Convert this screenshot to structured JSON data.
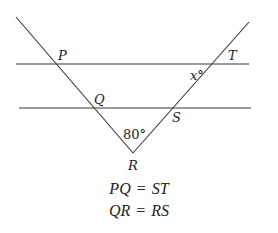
{
  "diagram": {
    "type": "geometry",
    "parallel_lines": [
      {
        "name": "upper-line",
        "x1": 16,
        "y1": 64,
        "x2": 249,
        "y2": 64
      },
      {
        "name": "lower-line",
        "x1": 19,
        "y1": 108,
        "x2": 251,
        "y2": 108
      }
    ],
    "transversals": [
      {
        "name": "left-transversal",
        "x1": 16,
        "y1": 17,
        "x2": 133,
        "y2": 153
      },
      {
        "name": "right-transversal",
        "x1": 133,
        "y1": 153,
        "x2": 249,
        "y2": 22
      }
    ],
    "points": {
      "P": {
        "label": "P",
        "x": 55,
        "y": 64
      },
      "Q": {
        "label": "Q",
        "x": 93,
        "y": 108
      },
      "R": {
        "label": "R",
        "x": 133,
        "y": 153
      },
      "S": {
        "label": "S",
        "x": 172,
        "y": 108
      },
      "T": {
        "label": "T",
        "x": 212,
        "y": 64
      }
    },
    "labels": {
      "P": "P",
      "Q": "Q",
      "R": "R",
      "S": "S",
      "T": "T",
      "angle_R": "80°",
      "angle_x": "x°"
    },
    "line_color": "#333333",
    "parallel_line_color": "#777777"
  },
  "equations": [
    {
      "lhs": "PQ",
      "op": "=",
      "rhs": "ST"
    },
    {
      "lhs": "QR",
      "op": "=",
      "rhs": "RS"
    }
  ]
}
